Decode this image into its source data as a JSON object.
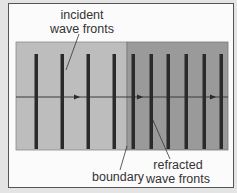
{
  "diagram": {
    "labels": {
      "incident_line1": "incident",
      "incident_line2": "wave fronts",
      "boundary": "boundary",
      "refracted_line1": "refracted",
      "refracted_line2": "wave fronts"
    },
    "colors": {
      "background": "#e4e4e4",
      "frame": "#fbfbfb",
      "medium_1": "#bdbdbd",
      "medium_2": "#9a9a9a",
      "wave_front": "#2a2a2a",
      "ray": "#3a3a3a"
    },
    "medium_1": {
      "wave_fronts": 4,
      "x_positions": [
        36,
        62,
        88,
        114
      ]
    },
    "medium_2": {
      "wave_fronts": 6,
      "x_positions": [
        133,
        151,
        168,
        186,
        204,
        221
      ]
    },
    "ray": {
      "arrow_x_positions": [
        77,
        140,
        213
      ]
    }
  }
}
